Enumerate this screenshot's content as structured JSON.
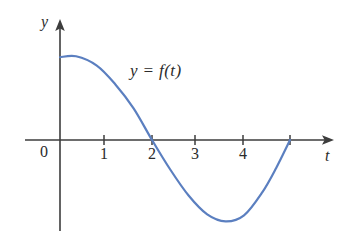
{
  "figure": {
    "background_color": "#ffffff",
    "axis_color": "#3d3d3d",
    "curve_color": "#5b7fc0",
    "function_label": "y = f(t)",
    "y_axis_label": "y",
    "x_axis_label": "t",
    "origin_label": "0"
  },
  "chart_data": {
    "type": "line",
    "title": "",
    "subtitle": "",
    "xlabel": "t",
    "ylabel": "y",
    "xlim": [
      -0.75,
      5.85
    ],
    "ylim": [
      -1.95,
      2.55
    ],
    "grid": false,
    "legend": "none",
    "annotations": [
      {
        "text": "y = f(t)",
        "x": 1.8,
        "y": 1.6,
        "style": "italic"
      }
    ],
    "x_ticks": [
      {
        "value": 1,
        "label": "1"
      },
      {
        "value": 2,
        "label": "2"
      },
      {
        "value": 3,
        "label": "3"
      },
      {
        "value": 4,
        "label": "4"
      },
      {
        "value": 5,
        "label": ""
      }
    ],
    "y_ticks": [],
    "origin_label": "0",
    "axes_style": "arrow-ended, no box, no gridlines",
    "series": [
      {
        "name": "y = f(t)",
        "color": "#5b7fc0",
        "zeros": [
          2,
          5
        ],
        "local_maximum": {
          "x": 0.35,
          "y": 1.8
        },
        "local_minimum": {
          "x": 3.6,
          "y": -1.75
        },
        "y_intercept": 1.78,
        "x": [
          0,
          0.35,
          0.8,
          1.2,
          1.6,
          2.0,
          2.4,
          2.8,
          3.2,
          3.6,
          4.0,
          4.4,
          4.7,
          5.0
        ],
        "y": [
          1.78,
          1.8,
          1.6,
          1.2,
          0.68,
          0.0,
          -0.64,
          -1.2,
          -1.6,
          -1.75,
          -1.62,
          -1.12,
          -0.6,
          0.0
        ]
      }
    ]
  }
}
